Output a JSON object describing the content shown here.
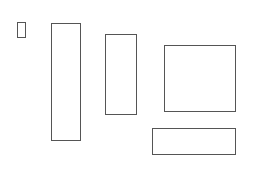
{
  "canvas": {
    "width": 253,
    "height": 170,
    "background": "#ffffff"
  },
  "shapes": [
    {
      "id": "rect-1",
      "x": 17,
      "y": 22,
      "w": 9,
      "h": 16,
      "stroke": "#555555"
    },
    {
      "id": "rect-2",
      "x": 51,
      "y": 23,
      "w": 30,
      "h": 118,
      "stroke": "#555555"
    },
    {
      "id": "rect-3",
      "x": 105,
      "y": 34,
      "w": 32,
      "h": 81,
      "stroke": "#555555"
    },
    {
      "id": "rect-4",
      "x": 164,
      "y": 45,
      "w": 72,
      "h": 67,
      "stroke": "#555555"
    },
    {
      "id": "rect-5",
      "x": 152,
      "y": 128,
      "w": 84,
      "h": 27,
      "stroke": "#555555"
    }
  ]
}
